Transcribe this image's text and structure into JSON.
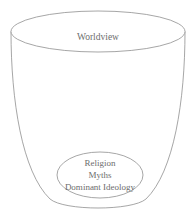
{
  "diagram": {
    "title": "Worldview",
    "type": "nested-vessel-diagram",
    "outer": {
      "label": "Worldview",
      "label_x": 98,
      "label_y": 38
    },
    "core": {
      "lines": [
        {
          "text": "Religion",
          "x": 100,
          "y": 164
        },
        {
          "text": "Myths",
          "x": 100,
          "y": 176
        },
        {
          "text": "Dominant Ideology",
          "x": 100,
          "y": 188
        }
      ]
    },
    "colors": {
      "background": "#ffffff",
      "stroke": "#8f8f8f",
      "text": "#6d6d6d"
    }
  }
}
